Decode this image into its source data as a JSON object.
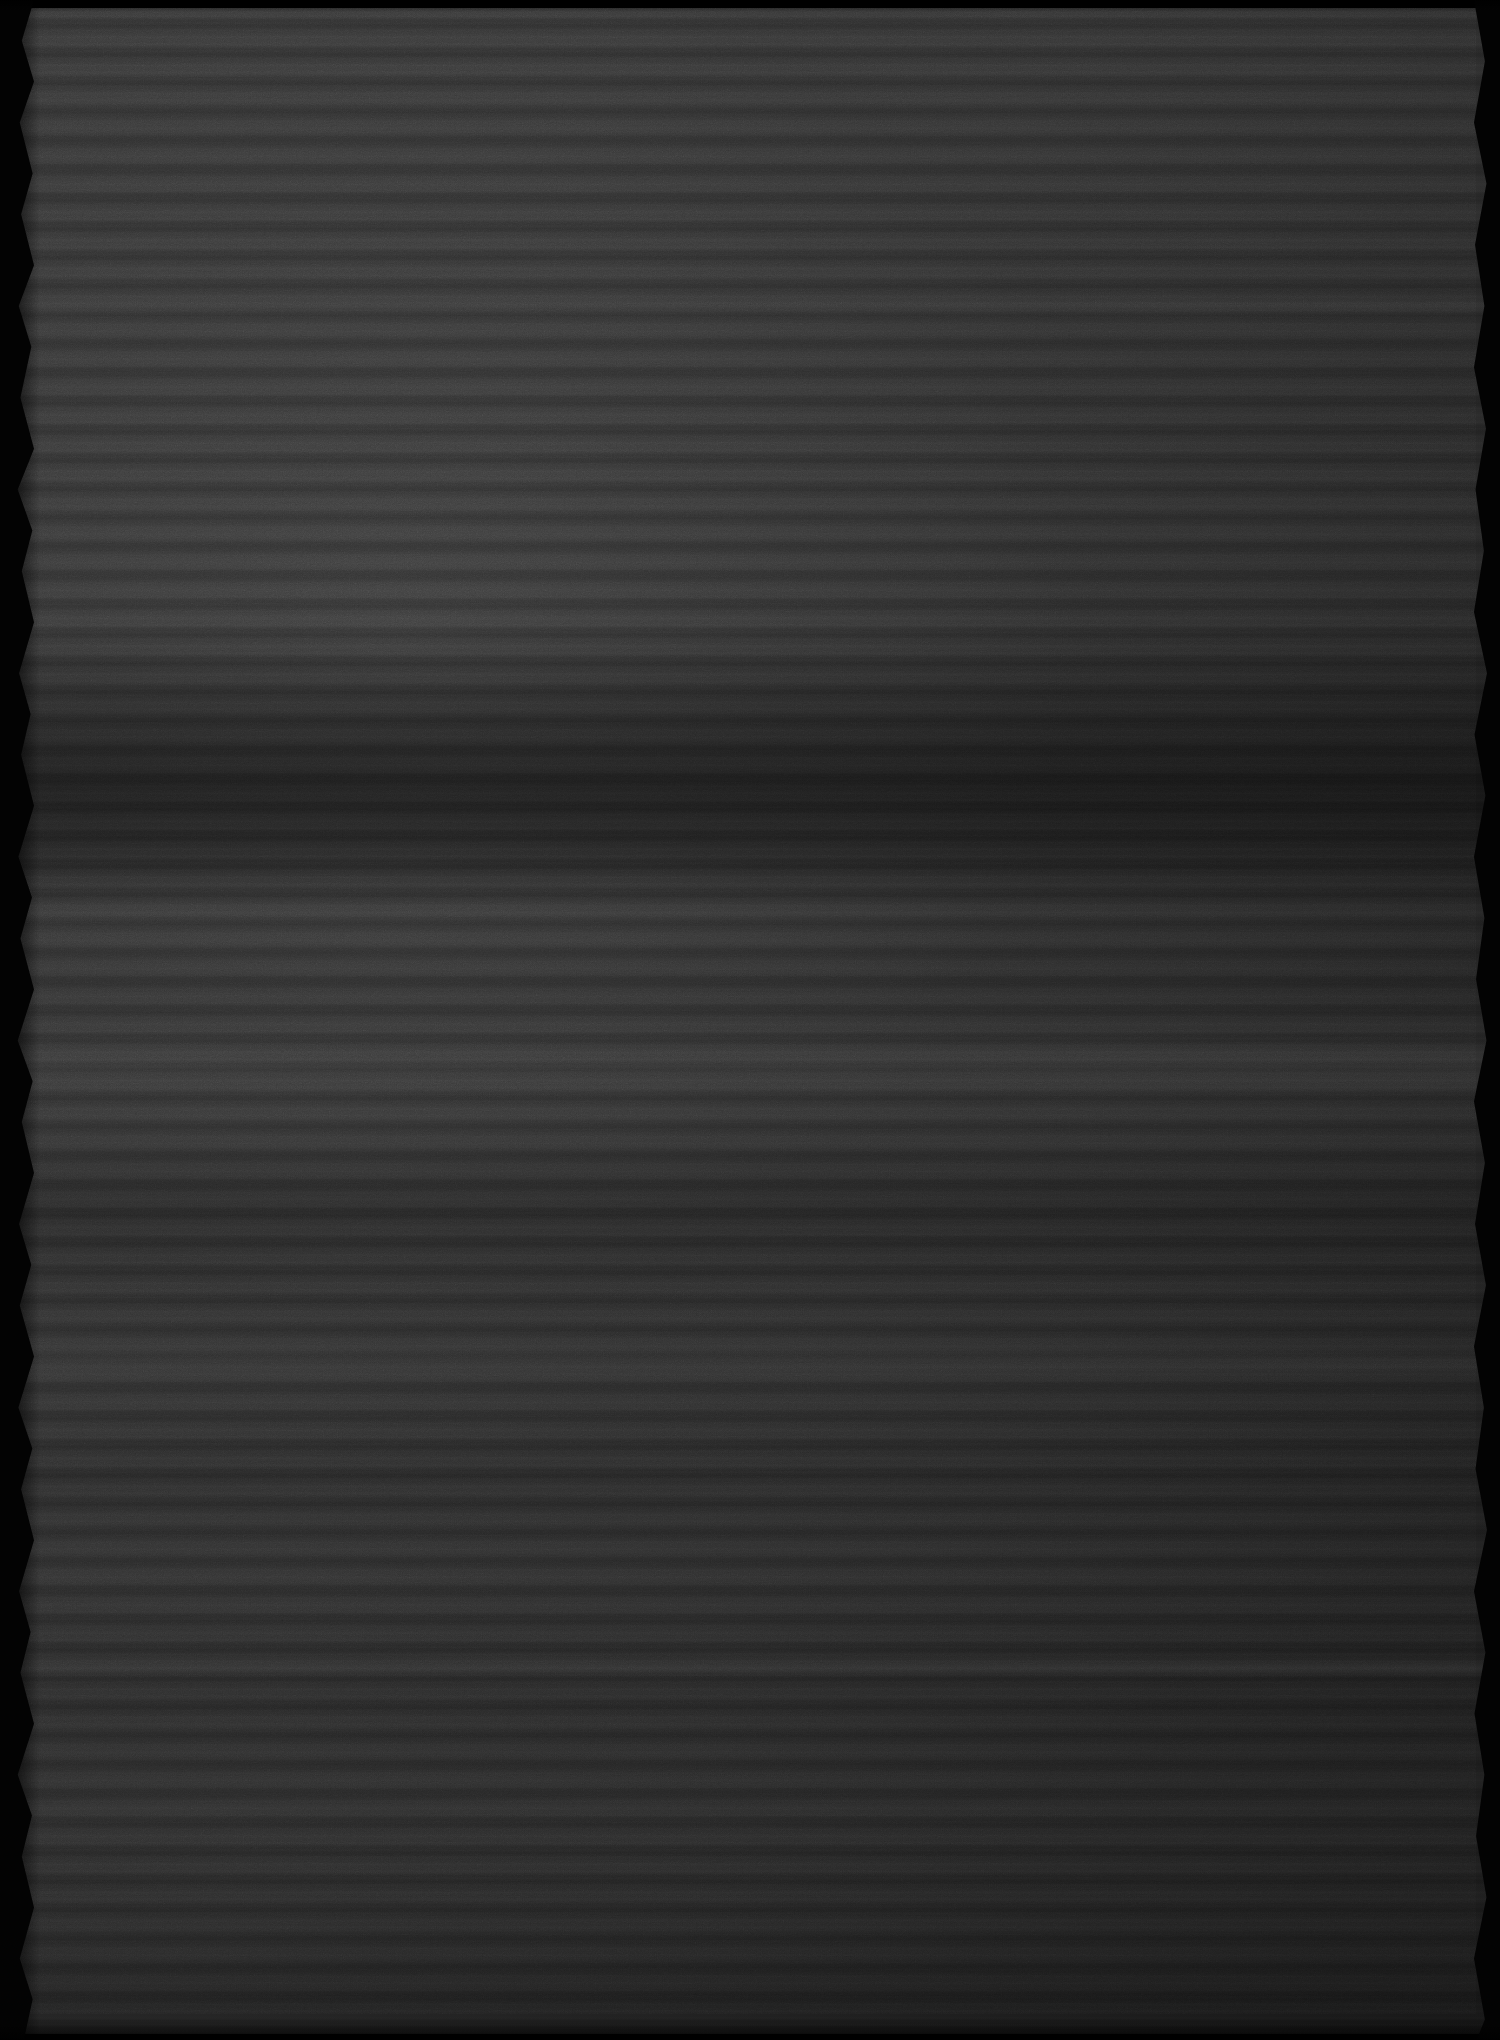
{
  "document": {
    "kind": "scanned-page",
    "page_title": "Scanned document page",
    "legibility": "illegible",
    "transcription": "",
    "note": "Severely underexposed scan of a printed text page. No characters are resolvable at any zoom level; only horizontal text-line banding, paragraph gaps and paper grain are visible."
  },
  "canvas": {
    "width": 1500,
    "height": 2040,
    "background": "#000000"
  },
  "sheet": {
    "left": 14,
    "top": 8,
    "width": 1482,
    "height": 2026,
    "paper_tone": "#373737",
    "edge_color": "#030303"
  },
  "palette": {
    "background_black": "#000000",
    "edge_black": "#030303",
    "paper_light": "#3b3b3b",
    "paper_mid": "#333333",
    "paper_dark": "#232323",
    "band_darkest": "#111111",
    "highlight": "#4a4a4a"
  },
  "layout": {
    "text_line_pitch_px": 29,
    "text_block_left_px": 40,
    "text_block_right_px": 1480,
    "first_line_y_px": 20
  },
  "bands": [
    {
      "name": "upper-text-block",
      "y": 8,
      "height": 480,
      "tone": "light",
      "description": "body text lines, brightest area of the scan"
    },
    {
      "name": "mid-text-block",
      "y": 488,
      "height": 200,
      "tone": "mid",
      "description": "continued body text"
    },
    {
      "name": "dense-dark-band",
      "y": 688,
      "height": 165,
      "tone": "darkest",
      "description": "heavily underexposed dense block"
    },
    {
      "name": "recovery-text-block",
      "y": 853,
      "height": 180,
      "tone": "mid",
      "description": "body text, exposure partially recovers"
    },
    {
      "name": "paragraph-gap",
      "y": 1033,
      "height": 68,
      "tone": "light",
      "description": "blank inter-paragraph whitespace"
    },
    {
      "name": "lower-text-block-a",
      "y": 1101,
      "height": 160,
      "tone": "dark",
      "description": "body text lines"
    },
    {
      "name": "lower-text-block-b",
      "y": 1261,
      "height": 200,
      "tone": "mid",
      "description": "body text lines"
    },
    {
      "name": "lower-text-block-c",
      "y": 1461,
      "height": 300,
      "tone": "dark",
      "description": "body text lines"
    },
    {
      "name": "footer-text-block",
      "y": 1761,
      "height": 273,
      "tone": "darkest",
      "description": "final lines, strong bottom vignette"
    }
  ],
  "paragraph_gaps": [
    {
      "y": 300,
      "height": 16
    },
    {
      "y": 1035,
      "height": 62
    },
    {
      "y": 1352,
      "height": 20
    },
    {
      "y": 1660,
      "height": 18
    }
  ],
  "edges": {
    "left": {
      "style": "jagged",
      "width": 34,
      "description": "zig-zag scan edge of the sheet against black"
    },
    "right": {
      "style": "jagged",
      "width": 26,
      "description": "zig-zag scan edge of the sheet against black"
    },
    "top": {
      "style": "soft",
      "height": 12
    },
    "bottom": {
      "style": "soft",
      "height": 16
    }
  }
}
